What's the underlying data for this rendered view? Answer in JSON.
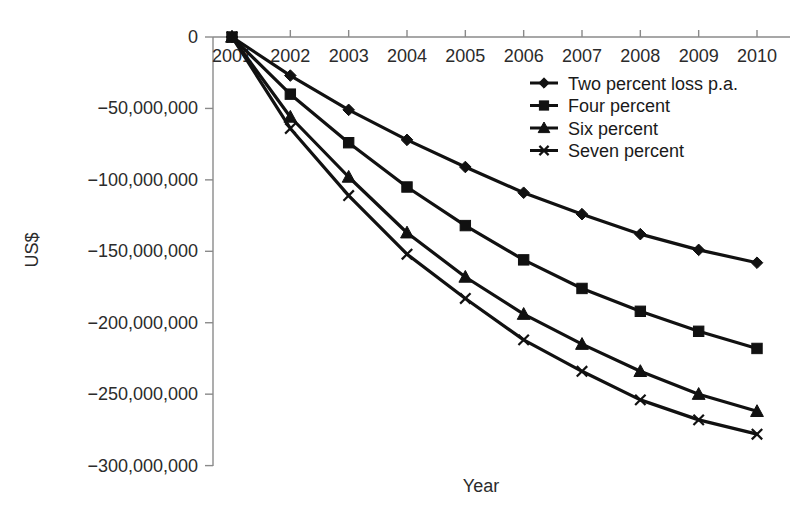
{
  "chart_data": {
    "type": "line",
    "title": "",
    "xlabel": "Year",
    "ylabel": "US$",
    "x": [
      2001,
      2002,
      2003,
      2004,
      2005,
      2006,
      2007,
      2008,
      2009,
      2010
    ],
    "categories": [
      "2001",
      "2002",
      "2003",
      "2004",
      "2005",
      "2006",
      "2007",
      "2008",
      "2009",
      "2010"
    ],
    "xtick_labels": [
      "2001",
      "2002",
      "2003",
      "2004",
      "2005",
      "2006",
      "2007",
      "2008",
      "2009",
      "2010"
    ],
    "ytick_labels": [
      "0",
      "−50,000,000",
      "−100,000,000",
      "−150,000,000",
      "−200,000,000",
      "−250,000,000",
      "−300,000,000"
    ],
    "ytick_values": [
      0,
      -50000000,
      -100000000,
      -150000000,
      -200000000,
      -250000000,
      -300000000
    ],
    "ylim": [
      -300000000,
      0
    ],
    "xlim": [
      2001,
      2010
    ],
    "grid": false,
    "legend_position": "upper right",
    "series": [
      {
        "name": "Two percent loss p.a.",
        "marker": "diamond",
        "color": "#111111",
        "values": [
          0,
          -27000000,
          -51000000,
          -72000000,
          -91000000,
          -109000000,
          -124000000,
          -138000000,
          -149000000,
          -158000000
        ]
      },
      {
        "name": "Four percent",
        "marker": "square",
        "color": "#111111",
        "values": [
          0,
          -40000000,
          -74000000,
          -105000000,
          -132000000,
          -156000000,
          -176000000,
          -192000000,
          -206000000,
          -218000000
        ]
      },
      {
        "name": "Six percent",
        "marker": "triangle",
        "color": "#111111",
        "values": [
          0,
          -56000000,
          -98000000,
          -137000000,
          -168000000,
          -194000000,
          -215000000,
          -234000000,
          -250000000,
          -262000000
        ]
      },
      {
        "name": "Seven percent",
        "marker": "x",
        "color": "#111111",
        "values": [
          0,
          -64000000,
          -111000000,
          -152000000,
          -183000000,
          -212000000,
          -234000000,
          -254000000,
          -268000000,
          -278000000
        ]
      }
    ]
  },
  "axes": {
    "y_title": "US$",
    "x_title": "Year"
  },
  "legend": {
    "items": [
      {
        "label": "Two percent loss p.a."
      },
      {
        "label": "Four percent"
      },
      {
        "label": "Six percent"
      },
      {
        "label": "Seven percent"
      }
    ]
  }
}
